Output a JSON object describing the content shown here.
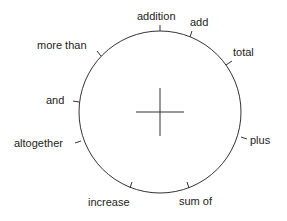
{
  "diagram": {
    "type": "word-wheel",
    "center_symbol": "plus-sign",
    "stroke_color": "#333333",
    "labels": [
      {
        "text": "addition"
      },
      {
        "text": "add"
      },
      {
        "text": "total"
      },
      {
        "text": "plus"
      },
      {
        "text": "sum of"
      },
      {
        "text": "increase"
      },
      {
        "text": "altogether"
      },
      {
        "text": "and"
      },
      {
        "text": "more than"
      }
    ]
  }
}
